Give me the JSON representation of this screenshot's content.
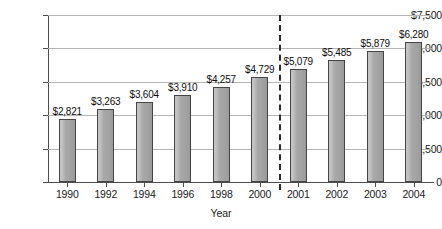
{
  "chart_data": {
    "type": "bar",
    "title": "",
    "xlabel": "Year",
    "ylabel": "",
    "categories": [
      "1990",
      "1992",
      "1994",
      "1996",
      "1998",
      "2000",
      "2001",
      "2002",
      "2003",
      "2004"
    ],
    "values": [
      2821,
      3263,
      3604,
      3910,
      4257,
      4729,
      5079,
      5485,
      5879,
      6280
    ],
    "value_labels": [
      "$2,821",
      "$3,263",
      "$3,604",
      "$3,910",
      "$4,257",
      "$4,729",
      "$5,079",
      "$5,485",
      "$5,879",
      "$6,280"
    ],
    "ylim": [
      0,
      7500
    ],
    "ytick_values": [
      0,
      1500,
      3000,
      4500,
      6000,
      7500
    ],
    "ytick_labels": [
      "0",
      "$1,500",
      "$3,000",
      "$4,500",
      "$6,000",
      "$7,500"
    ],
    "grid": "horizontal",
    "legend": "none",
    "annotations": [
      {
        "type": "vertical-dashed-line",
        "label": "",
        "between": [
          "2000",
          "2001"
        ]
      }
    ],
    "series": [
      {
        "name": "",
        "values": [
          2821,
          3263,
          3604,
          3910,
          4257,
          4729,
          5079,
          5485,
          5879,
          6280
        ]
      }
    ],
    "colors": {
      "bar_fill": "#a8a8a8",
      "bar_border": "#454545",
      "gridline": "#b5b5b5",
      "axis": "#4d4d4d",
      "text": "#1a1a1a",
      "divider": "#2b2b2b",
      "background": "#ffffff"
    }
  }
}
